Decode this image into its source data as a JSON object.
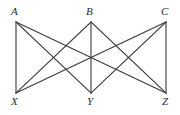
{
  "figure": {
    "name": "complete-bipartite-graph-k33",
    "width": 180,
    "height": 115,
    "background_color": "#ffffff",
    "edge_color": "#3a3a3a",
    "edge_width": 1.1,
    "label_color": "#2b2b2b"
  },
  "chart_data": {
    "type": "diagram",
    "diagram_type": "graph",
    "title": "",
    "nodes": [
      {
        "id": "A",
        "label": "A",
        "x": 16,
        "y": 22,
        "group": "top",
        "label_x": 11,
        "label_y": 6
      },
      {
        "id": "B",
        "label": "B",
        "x": 91,
        "y": 22,
        "group": "top",
        "label_x": 86,
        "label_y": 6
      },
      {
        "id": "C",
        "label": "C",
        "x": 166,
        "y": 22,
        "group": "top",
        "label_x": 161,
        "label_y": 6
      },
      {
        "id": "X",
        "label": "X",
        "x": 16,
        "y": 93,
        "group": "bottom",
        "label_x": 11,
        "label_y": 96
      },
      {
        "id": "Y",
        "label": "Y",
        "x": 91,
        "y": 93,
        "group": "bottom",
        "label_x": 87,
        "label_y": 96
      },
      {
        "id": "Z",
        "label": "Z",
        "x": 166,
        "y": 93,
        "group": "bottom",
        "label_x": 162,
        "label_y": 96
      }
    ],
    "edges": [
      {
        "from": "A",
        "to": "X"
      },
      {
        "from": "A",
        "to": "Y"
      },
      {
        "from": "A",
        "to": "Z"
      },
      {
        "from": "B",
        "to": "X"
      },
      {
        "from": "B",
        "to": "Y"
      },
      {
        "from": "B",
        "to": "Z"
      },
      {
        "from": "C",
        "to": "X"
      },
      {
        "from": "C",
        "to": "Y"
      },
      {
        "from": "C",
        "to": "Z"
      }
    ],
    "node_count": 6,
    "edge_count": 9,
    "legend": [],
    "grid": false
  }
}
